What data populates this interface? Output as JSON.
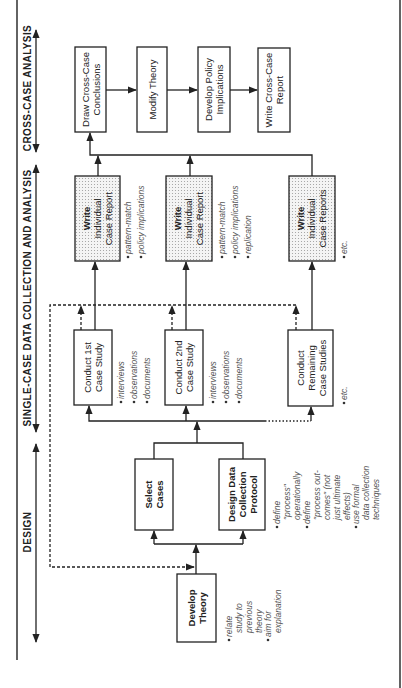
{
  "phases": {
    "cross_case": "CROSS-CASE ANALYSIS",
    "single_case": "SINGLE-CASE DATA COLLECTION AND ANALYSIS",
    "design": "DESIGN"
  },
  "boxes": {
    "develop_theory": [
      "Develop",
      "Theory"
    ],
    "select_cases": [
      "Select",
      "Cases"
    ],
    "design_protocol": [
      "Design Data",
      "Collection",
      "Protocol"
    ],
    "conduct_1st": [
      "Conduct 1st",
      "Case Study"
    ],
    "conduct_2nd": [
      "Conduct 2nd",
      "Case Study"
    ],
    "conduct_remaining": [
      "Conduct",
      "Remaining",
      "Case Studies"
    ],
    "write_report_1": [
      "Write",
      "Individual",
      "Case Report"
    ],
    "write_report_2": [
      "Write",
      "Individual",
      "Case Report"
    ],
    "write_reports_remaining": [
      "Write",
      "Individual",
      "Case Reports"
    ],
    "draw_conclusions": [
      "Draw Cross-Case",
      "Conclusions"
    ],
    "modify_theory": [
      "Modify Theory"
    ],
    "develop_policy": [
      "Develop Policy",
      "Implications"
    ],
    "write_cross_case": [
      "Write Cross-Case",
      "Report"
    ]
  },
  "notes": {
    "develop_theory": [
      [
        "relate",
        "study to",
        "previous",
        "theory"
      ],
      [
        "aim for",
        "explanation"
      ]
    ],
    "design_protocol": [
      [
        "define",
        "\"process\"",
        "operationally"
      ],
      [
        "define",
        "\"process out-",
        "comes\" (not",
        "just ultimate",
        "effects)"
      ],
      [
        "use formal",
        "data collection",
        "techniques"
      ]
    ],
    "conduct_1st": [
      [
        "interviews"
      ],
      [
        "observations"
      ],
      [
        "documents"
      ]
    ],
    "conduct_2nd": [
      [
        "interviews"
      ],
      [
        "observations"
      ],
      [
        "documents"
      ]
    ],
    "conduct_remaining": [
      [
        "etc."
      ]
    ],
    "write_report_1": [
      [
        "pattern-match"
      ],
      [
        "policy implications"
      ]
    ],
    "write_report_2": [
      [
        "pattern-match"
      ],
      [
        "policy implications"
      ],
      [
        "replication"
      ]
    ],
    "write_reports_remaining": [
      [
        "etc."
      ]
    ]
  },
  "colors": {
    "line": "#222222",
    "note_text": "#555555",
    "shading": "#d8d8d8"
  }
}
